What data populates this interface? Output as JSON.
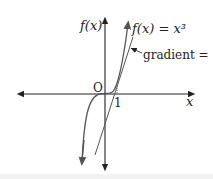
{
  "diagram": {
    "y_axis_label": "f(x)",
    "x_axis_label": "x",
    "origin_label": "O",
    "tick_label_1": "1",
    "curve_label": "f(x) = x³",
    "tangent_label": "gradient = 3",
    "colors": {
      "axes": "#222222",
      "curve": "#555555",
      "text": "#222222"
    }
  }
}
